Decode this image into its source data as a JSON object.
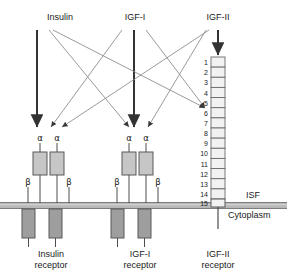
{
  "figure": {
    "type": "biological-schematic"
  },
  "ligands": [
    {
      "id": "insulin",
      "label": "Insulin",
      "x": 60,
      "y": 18
    },
    {
      "id": "igf1",
      "label": "IGF-I",
      "x": 135,
      "y": 18
    },
    {
      "id": "igf2",
      "label": "IGF-II",
      "x": 218,
      "y": 18
    }
  ],
  "compartments": {
    "isf_label": "ISF",
    "cytoplasm_label": "Cytoplasm",
    "membrane_color": "#b3b3b3",
    "isf_x": 248,
    "isf_y": 196,
    "cytoplasm_x": 240,
    "cytoplasm_y": 212
  },
  "receptors": [
    {
      "id": "insulin-receptor",
      "name_line1": "Insulin",
      "name_line2": "receptor",
      "center_x": 51,
      "subunits_alpha": [
        "α",
        "α"
      ],
      "subunits_beta": [
        "β",
        "β"
      ]
    },
    {
      "id": "igf1-receptor",
      "name_line1": "IGF-I",
      "name_line2": "receptor",
      "center_x": 140,
      "subunits_alpha": [
        "α",
        "α"
      ],
      "subunits_beta": [
        "β",
        "β"
      ]
    },
    {
      "id": "igf2-receptor",
      "name_line1": "IGF-II",
      "name_line2": "receptor",
      "center_x": 218,
      "repeat_numbers": [
        "1",
        "2",
        "3",
        "4",
        "5",
        "6",
        "7",
        "8",
        "9",
        "10",
        "11",
        "12",
        "13",
        "14",
        "15"
      ]
    }
  ],
  "colors": {
    "alpha_box_fill": "#c6c6c6",
    "beta_box_fill": "#9e9e9e",
    "repeat_box_fill": "#f2f2f2",
    "stroke": "#4d4d4d",
    "arrow": "#333333",
    "thin_arrow": "#8a8a8a",
    "text": "#1a1a1a"
  },
  "bindings": [
    {
      "from": "Insulin",
      "to": "Insulin receptor",
      "style": "thick"
    },
    {
      "from": "Insulin",
      "to": "IGF-I receptor",
      "style": "thin"
    },
    {
      "from": "Insulin",
      "to": "IGF-II receptor",
      "style": "thin"
    },
    {
      "from": "IGF-I",
      "to": "IGF-I receptor",
      "style": "thick"
    },
    {
      "from": "IGF-I",
      "to": "Insulin receptor",
      "style": "thin"
    },
    {
      "from": "IGF-I",
      "to": "IGF-II receptor",
      "style": "thin"
    },
    {
      "from": "IGF-II",
      "to": "IGF-II receptor",
      "style": "thick"
    },
    {
      "from": "IGF-II",
      "to": "Insulin receptor",
      "style": "thin"
    },
    {
      "from": "IGF-II",
      "to": "IGF-I receptor",
      "style": "thin"
    }
  ]
}
